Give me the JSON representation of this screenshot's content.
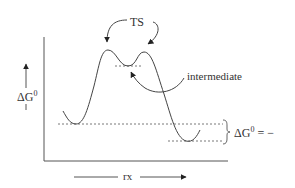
{
  "diagram": {
    "type": "reaction-energy-profile",
    "y_axis": {
      "label": "ΔG",
      "label_superscript": "0"
    },
    "x_axis": {
      "label": "rx"
    },
    "annotations": {
      "transition_state": "TS",
      "intermediate": "intermediate",
      "delta_g_label": "ΔG",
      "delta_g_superscript": "0",
      "delta_g_relation": " = −"
    },
    "features": {
      "transition_states": 2,
      "intermediates": 1,
      "energy_levels": [
        "reactants",
        "products"
      ],
      "overall_sign": "negative"
    },
    "colors": {
      "stroke": "#444444",
      "text": "#333333",
      "background": "#ffffff"
    }
  }
}
